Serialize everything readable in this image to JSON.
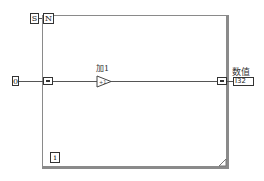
{
  "diagram": {
    "shift_register_label": "S",
    "count_terminal_label": "N",
    "iteration_terminal_label": "i",
    "input_constant_value": "0",
    "increment_node_label": "加1",
    "increment_symbol": "+1",
    "output_indicator_label": "数值",
    "output_indicator_type": "I32"
  },
  "colors": {
    "frame": "#8a8a8a",
    "wire": "#555555",
    "terminal_border": "#333333"
  }
}
